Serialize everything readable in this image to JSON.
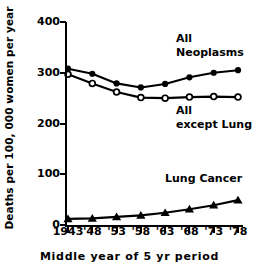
{
  "chart_data": {
    "type": "line",
    "title": "",
    "xlabel": "Middle year of 5 yr period",
    "ylabel": "Deaths per 100, 000 women per year",
    "x": [
      1943,
      1948,
      1953,
      1958,
      1963,
      1968,
      1973,
      1978
    ],
    "xtick_labels": [
      "1943",
      "'48",
      "'53",
      "'58",
      "'63",
      "'68",
      "'73",
      "'78"
    ],
    "ytick_labels": [
      "0",
      "100",
      "200",
      "300",
      "400"
    ],
    "ytick_values": [
      0,
      100,
      200,
      300,
      400
    ],
    "ylim": [
      0,
      400
    ],
    "grid": false,
    "legend_position": "inline-annotations",
    "series": [
      {
        "name": "All Neoplasms",
        "marker": "filled-circle",
        "values": [
          308,
          298,
          279,
          271,
          278,
          291,
          300,
          305
        ],
        "annotation": "All\nNeoplasms"
      },
      {
        "name": "All except Lung",
        "marker": "open-circle",
        "values": [
          297,
          279,
          262,
          251,
          250,
          252,
          253,
          252
        ],
        "annotation": "All\nexcept Lung"
      },
      {
        "name": "Lung Cancer",
        "marker": "filled-triangle",
        "values": [
          12,
          13,
          16,
          19,
          24,
          31,
          39,
          49
        ],
        "annotation": "Lung Cancer"
      }
    ]
  },
  "annotations": {
    "neoplasms_line1": "All",
    "neoplasms_line2": "Neoplasms",
    "exceptlung_line1": "All",
    "exceptlung_line2": "except Lung",
    "lungcancer": "Lung Cancer"
  },
  "colors": {
    "ink": "#000000",
    "background": "#ffffff"
  }
}
